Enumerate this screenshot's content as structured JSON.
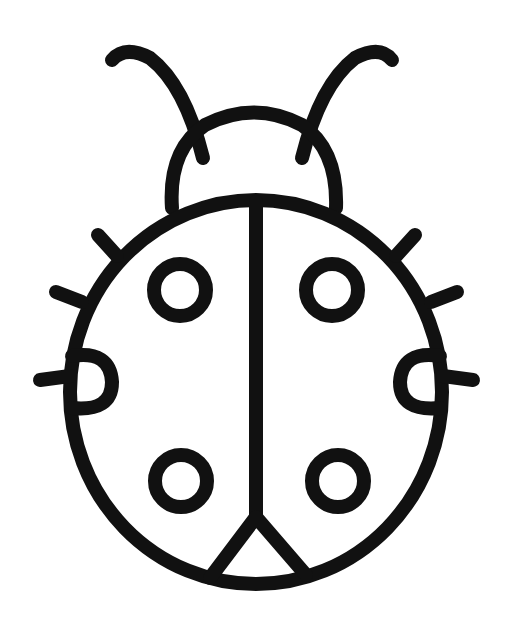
{
  "image": {
    "subject": "ladybug line drawing",
    "background": "#ffffff",
    "stroke": "#111111",
    "width": 513,
    "height": 627
  }
}
